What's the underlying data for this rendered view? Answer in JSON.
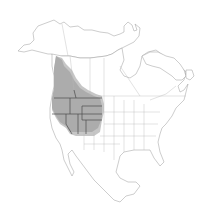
{
  "map": {
    "type": "range-map",
    "region": "North America",
    "range_label": "Range",
    "colors": {
      "background": "#ffffff",
      "land_fill": "#ffffff",
      "outline": "#9a9a9a",
      "range_fill": "#ababab",
      "range_border": "#4a4a4a"
    },
    "shaded_regions": [
      "British Columbia",
      "Washington",
      "Oregon",
      "Idaho",
      "Montana",
      "Wyoming",
      "Nevada",
      "Utah",
      "California (northeast)",
      "Colorado (west)",
      "Alberta (southwest)"
    ]
  }
}
